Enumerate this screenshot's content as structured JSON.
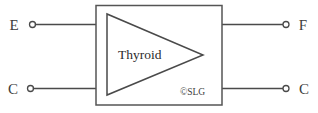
{
  "diagram": {
    "type": "block-diagram",
    "background_color": "#ffffff",
    "line_color": "#4a4a4a",
    "block": {
      "label": "Thyroid",
      "symbol": "amplifier-triangle",
      "outline": "rectangle"
    },
    "credit": {
      "text": "©SLG"
    },
    "ports": [
      {
        "id": "left-top",
        "label": "E",
        "side": "left",
        "terminal": "open-circle"
      },
      {
        "id": "left-bottom",
        "label": "C",
        "side": "left",
        "terminal": "open-circle"
      },
      {
        "id": "right-top",
        "label": "F",
        "side": "right",
        "terminal": "open-circle"
      },
      {
        "id": "right-bottom",
        "label": "C",
        "side": "right",
        "terminal": "open-circle"
      }
    ]
  }
}
